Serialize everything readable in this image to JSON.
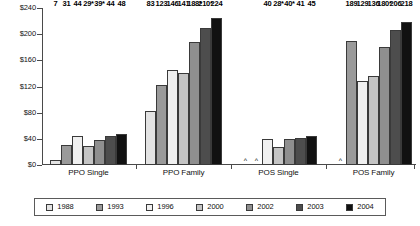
{
  "chart_data": {
    "type": "bar",
    "title": "",
    "subtitle": "",
    "xlabel": "",
    "ylabel": "",
    "ylim": [
      0,
      240
    ],
    "ytick_values": [
      0,
      40,
      80,
      120,
      160,
      200,
      240
    ],
    "ytick_labels": [
      "$0",
      "$40",
      "$80",
      "$120",
      "$160",
      "$200",
      "$240"
    ],
    "grid": false,
    "legend_position": "bottom",
    "categories": [
      "PPO Single",
      "PPO Family",
      "POS Single",
      "POS Family"
    ],
    "series": [
      {
        "name": "1988",
        "color": "#e3e3e3",
        "values": [
          7,
          83,
          null,
          null
        ],
        "labels": [
          "7",
          "83",
          "^",
          "^"
        ]
      },
      {
        "name": "1993",
        "color": "#9a9a9a",
        "values": [
          31,
          123,
          null,
          189
        ],
        "labels": [
          "31",
          "123",
          "^",
          "189"
        ]
      },
      {
        "name": "1996",
        "color": "#f0f0f0",
        "values": [
          44,
          146,
          40,
          129
        ],
        "labels": [
          "44",
          "146",
          "40",
          "129"
        ]
      },
      {
        "name": "2000",
        "color": "#c4c4c4",
        "values": [
          29,
          141,
          28,
          136
        ],
        "labels": [
          "29*",
          "141",
          "28*",
          "136"
        ]
      },
      {
        "name": "2002",
        "color": "#8f8f8f",
        "values": [
          39,
          188,
          40,
          180
        ],
        "labels": [
          "39*",
          "188*",
          "40*",
          "180*"
        ]
      },
      {
        "name": "2003",
        "color": "#4d4d4d",
        "values": [
          44,
          210,
          41,
          206
        ],
        "labels": [
          "44",
          "210*",
          "41",
          "206"
        ]
      },
      {
        "name": "2004",
        "color": "#111111",
        "values": [
          48,
          224,
          45,
          218
        ],
        "labels": [
          "48",
          "224",
          "45",
          "218"
        ]
      }
    ],
    "missing_marker": "^",
    "axis_color": "#4a4a4a"
  }
}
